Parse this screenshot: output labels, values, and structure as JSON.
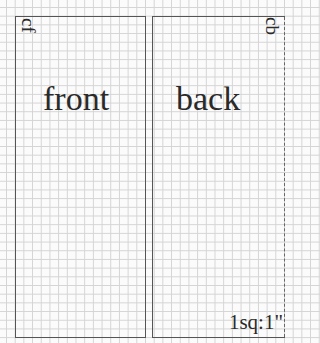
{
  "diagram": {
    "type": "sewing-pattern-layout",
    "grid": {
      "scale_label": "1sq:1\""
    },
    "panels": [
      {
        "name": "front",
        "label": "front",
        "edge_label": "cf",
        "edge_meaning": "center front"
      },
      {
        "name": "back",
        "label": "back",
        "edge_label": "cb",
        "edge_meaning": "center back",
        "fold_edge": "dashed right"
      }
    ]
  }
}
